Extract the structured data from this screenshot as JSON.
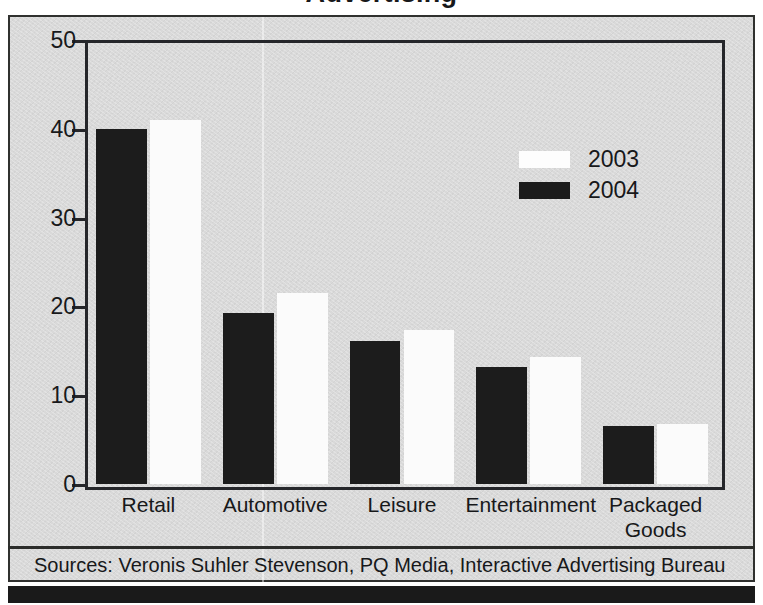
{
  "figure": {
    "title_partial": "Advertising",
    "source_note": "Sources: Veronis Suhler Stevenson, PQ Media, Interactive Advertising Bureau"
  },
  "chart_data": {
    "type": "bar",
    "title": "Advertising",
    "xlabel": "",
    "ylabel": "",
    "ylim": [
      0,
      50
    ],
    "yticks": [
      0,
      10,
      20,
      30,
      40,
      50
    ],
    "ytick_labels": [
      "0",
      "10",
      "20",
      "30",
      "40",
      "50"
    ],
    "grid": false,
    "legend_position": "upper-right",
    "categories": [
      "Retail",
      "Automotive",
      "Leisure",
      "Entertainment",
      "Packaged Goods"
    ],
    "category_labels": [
      [
        "Retail"
      ],
      [
        "Automotive"
      ],
      [
        "Leisure"
      ],
      [
        "Entertainment"
      ],
      [
        "Packaged",
        "Goods"
      ]
    ],
    "series": [
      {
        "name": "2004",
        "color": "#1c1c1c",
        "order_in_group": 1,
        "values": [
          40.0,
          19.3,
          16.1,
          13.2,
          6.5
        ]
      },
      {
        "name": "2003",
        "color": "#fbfbfb",
        "order_in_group": 2,
        "values": [
          41.0,
          21.5,
          17.3,
          14.3,
          6.8
        ]
      }
    ]
  },
  "legend": {
    "entries": [
      {
        "label": "2003",
        "swatch": "white"
      },
      {
        "label": "2004",
        "swatch": "black"
      }
    ]
  },
  "colors": {
    "panel_background": "#d9d9d9",
    "frame": "#25262a",
    "bar_dark": "#1c1c1c",
    "bar_light": "#fbfbfb",
    "text": "#17181a",
    "bottom_bar": "#1a1a1a"
  }
}
